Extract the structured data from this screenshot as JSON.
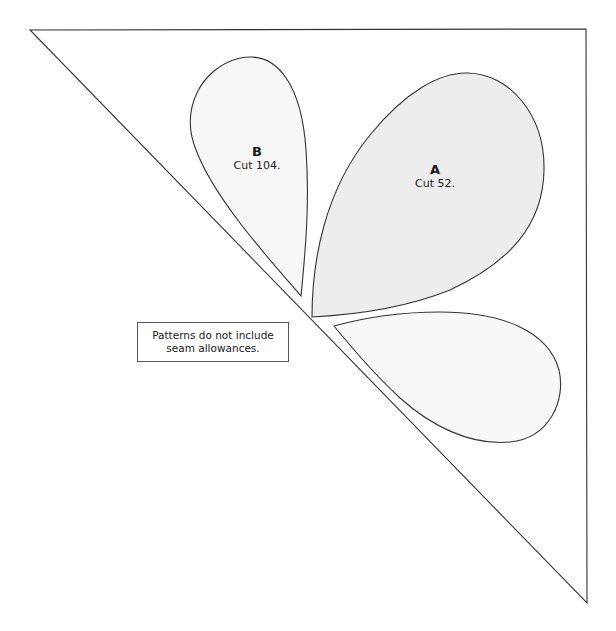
{
  "pattern": {
    "pieces": [
      {
        "id": "A",
        "letter": "A",
        "cut": "Cut 52.",
        "fill": "#ededed"
      },
      {
        "id": "B",
        "letter": "B",
        "cut": "Cut 104.",
        "fill": "#f7f7f7"
      },
      {
        "id": "C",
        "letter": "",
        "cut": "",
        "fill": "#f8f8f8"
      }
    ],
    "notice": "Patterns do not include seam allowances.",
    "colors": {
      "outline": "#333333",
      "background": "#ffffff"
    }
  }
}
